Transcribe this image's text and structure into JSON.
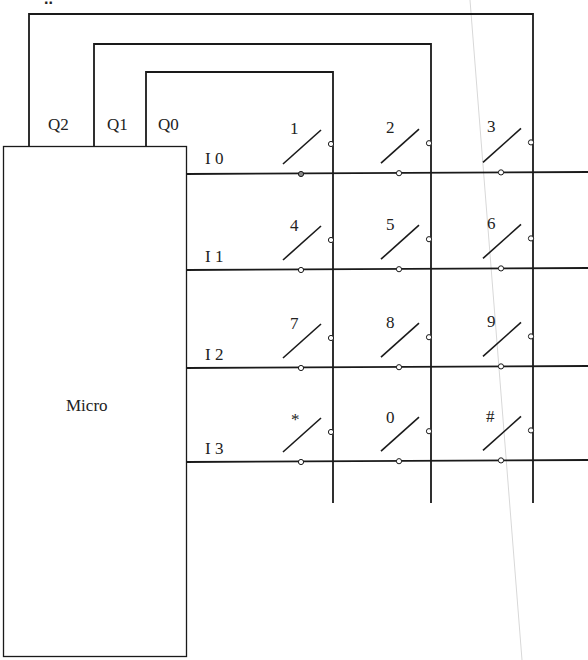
{
  "heading_fragment": "..",
  "micro": {
    "label": "Micro"
  },
  "outputs": [
    {
      "label": "Q2",
      "x": 29,
      "loop_top": 14,
      "col_x": 533
    },
    {
      "label": "Q1",
      "x": 94,
      "loop_top": 44,
      "col_x": 431
    },
    {
      "label": "Q0",
      "x": 146,
      "loop_top": 72,
      "col_x": 333
    }
  ],
  "inputs": [
    {
      "label": "I 0",
      "y": 174
    },
    {
      "label": "I 1",
      "y": 270
    },
    {
      "label": "I 2",
      "y": 368
    },
    {
      "label": "I 3",
      "y": 462
    }
  ],
  "keys": [
    [
      "1",
      "2",
      "3"
    ],
    [
      "4",
      "5",
      "6"
    ],
    [
      "7",
      "8",
      "9"
    ],
    [
      "*",
      "0",
      "#"
    ]
  ],
  "colors": {
    "line": "#1a1a1a",
    "text": "#222222",
    "fold": "#d8d8d8"
  }
}
